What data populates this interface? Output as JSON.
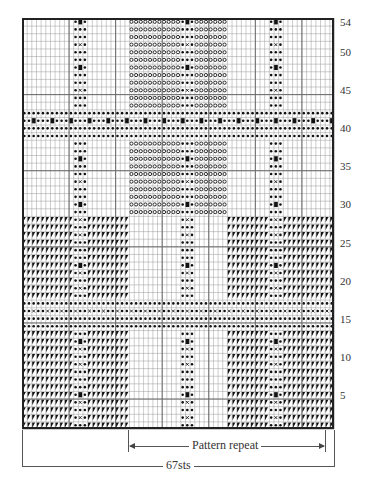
{
  "chart": {
    "title": "",
    "stitches": 67,
    "rows": 54,
    "row_labels": [
      54,
      50,
      45,
      40,
      35,
      30,
      25,
      20,
      15,
      10,
      5
    ],
    "pattern_repeat_label": "Pattern repeat",
    "width_label": "67sts",
    "symbols": {
      "blank": "plain stitch",
      "dot": "bullet",
      "circle": "open circle",
      "square": "filled square",
      "cross": "x mark",
      "triangle": "half-filled corner triangle"
    },
    "colors": {
      "grid": "#9a9a9a",
      "major_grid": "#6a6a6a",
      "border": "#222222",
      "symbol": "#111111"
    }
  },
  "chart_data": {
    "type": "table",
    "xlabel": "67sts",
    "ylabel": "Rows",
    "ylim": [
      1,
      54
    ],
    "yticks": [
      5,
      10,
      15,
      20,
      25,
      30,
      35,
      40,
      45,
      50,
      54
    ],
    "annotations": [
      "Pattern repeat",
      "67sts"
    ],
    "sections": [
      {
        "rows": [
          1,
          13
        ],
        "description": "triangle blocks with dot columns at sts 12-14 and 54-56; center dot column sts 35-37; squares and crosses alternating"
      },
      {
        "rows": [
          14,
          17
        ],
        "description": "horizontal band of dots with crosses on row 16"
      },
      {
        "rows": [
          18,
          28
        ],
        "description": "triangle blocks as rows 1-13"
      },
      {
        "rows": [
          29,
          38
        ],
        "description": "open-circle block sts 24-44 with dot column; dot columns at sts 12-14 and 54-56"
      },
      {
        "rows": [
          39,
          42
        ],
        "description": "horizontal dot band with squares on row 41"
      },
      {
        "rows": [
          43,
          54
        ],
        "description": "as rows 29-38"
      }
    ]
  }
}
